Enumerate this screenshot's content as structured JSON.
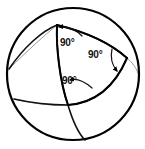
{
  "figure": {
    "type": "geometric-diagram",
    "canvas": {
      "width": 145,
      "height": 149
    },
    "colors": {
      "background": "#ffffff",
      "outline": "#000000",
      "triangle": "#000000",
      "back_arc": "#9a9a9a",
      "label_text": "#111111",
      "arrow": "#000000"
    },
    "sphere": {
      "name": "sphere-outline",
      "center_x": 73,
      "center_y": 74,
      "radius": 66,
      "stroke_width": 2.2
    },
    "vertices": [
      {
        "name": "vertex-top",
        "x": 57,
        "y": 25
      },
      {
        "name": "vertex-right",
        "x": 127,
        "y": 58
      },
      {
        "name": "vertex-bottom",
        "x": 68,
        "y": 105
      }
    ],
    "angle_labels": [
      {
        "id": "label-top",
        "text": "90°",
        "x": 60,
        "y": 38
      },
      {
        "id": "label-right",
        "text": "90°",
        "x": 88,
        "y": 50
      },
      {
        "id": "label-bottom",
        "text": "90°",
        "x": 62,
        "y": 76
      }
    ],
    "edges": [
      {
        "name": "arc-top-to-right",
        "from": "vertex-top",
        "to": "vertex-right"
      },
      {
        "name": "arc-right-to-bottom",
        "from": "vertex-right",
        "to": "vertex-bottom"
      },
      {
        "name": "arc-bottom-to-top",
        "from": "vertex-bottom",
        "to": "vertex-top"
      }
    ],
    "back_arcs": [
      {
        "name": "back-arc-upper-left"
      },
      {
        "name": "back-arc-lower-left"
      }
    ]
  }
}
